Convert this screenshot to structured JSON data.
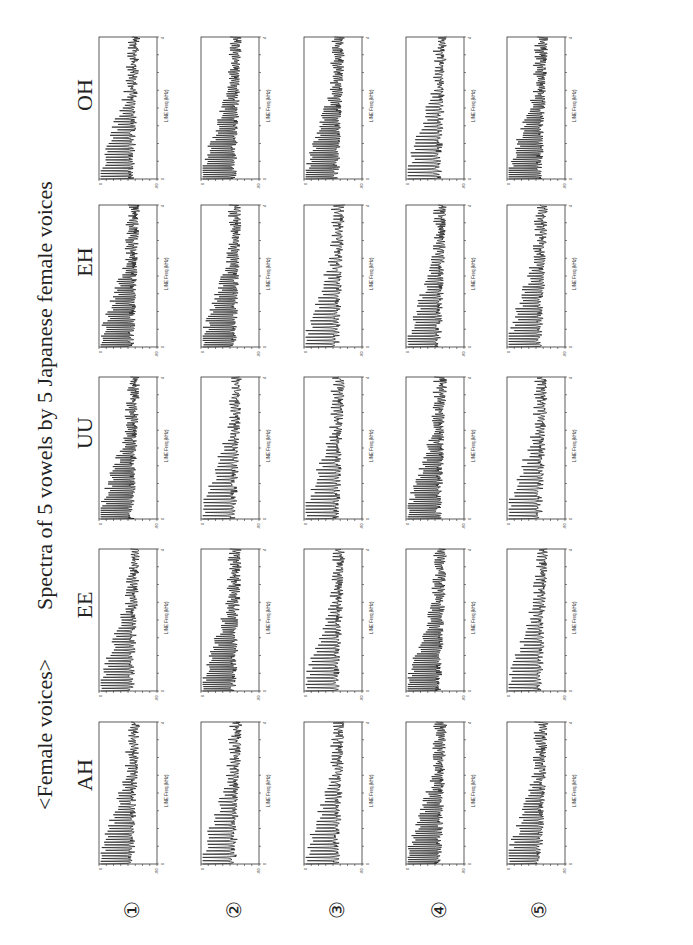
{
  "header": {
    "group_label": "<Female voices>",
    "title": "Spectra of 5 vowels by 5 Japanese female voices"
  },
  "columns": [
    {
      "label": "AH"
    },
    {
      "label": "EE"
    },
    {
      "label": "UU"
    },
    {
      "label": "EH"
    },
    {
      "label": "OH"
    }
  ],
  "rows": [
    {
      "label": "①"
    },
    {
      "label": "②"
    },
    {
      "label": "③"
    },
    {
      "label": "④"
    },
    {
      "label": "⑤"
    }
  ],
  "axes": {
    "ylabel": "MAG. (dB)",
    "xlabel": "LINE Freq.(kHz)",
    "y_ticks": [
      "0",
      "-80"
    ],
    "x_ticks": [
      "0",
      "4"
    ]
  },
  "colors": {
    "trace": "#1a1a1a",
    "frame": "#333333"
  },
  "chart_data": {
    "type": "line",
    "title": "Spectra of 5 vowels by 5 Japanese female voices",
    "subtitle": "<Female voices>",
    "layout": "5x5 grid of small multiples; columns = vowels (AH, EE, UU, EH, OH), rows = speakers (1-5)",
    "xlabel": "LINE Freq.(kHz)",
    "ylabel": "MAG. (dB)",
    "xlim": [
      0,
      4
    ],
    "ylim": [
      -80,
      0
    ],
    "x_tick_count": 9,
    "y_tick_count": 9,
    "grid": false,
    "series_description": "Each panel shows a harmonic magnitude spectrum: strong harmonic peaks (near 0 to -20 dB) below ~1.5 kHz, tapering to a noisy floor around -40 to -60 dB toward 4 kHz",
    "panels": [
      {
        "row": 1,
        "vowel": "AH"
      },
      {
        "row": 1,
        "vowel": "EE"
      },
      {
        "row": 1,
        "vowel": "UU"
      },
      {
        "row": 1,
        "vowel": "EH"
      },
      {
        "row": 1,
        "vowel": "OH"
      },
      {
        "row": 2,
        "vowel": "AH"
      },
      {
        "row": 2,
        "vowel": "EE"
      },
      {
        "row": 2,
        "vowel": "UU"
      },
      {
        "row": 2,
        "vowel": "EH"
      },
      {
        "row": 2,
        "vowel": "OH"
      },
      {
        "row": 3,
        "vowel": "AH"
      },
      {
        "row": 3,
        "vowel": "EE"
      },
      {
        "row": 3,
        "vowel": "UU"
      },
      {
        "row": 3,
        "vowel": "EH"
      },
      {
        "row": 3,
        "vowel": "OH"
      },
      {
        "row": 4,
        "vowel": "AH"
      },
      {
        "row": 4,
        "vowel": "EE"
      },
      {
        "row": 4,
        "vowel": "UU"
      },
      {
        "row": 4,
        "vowel": "EH"
      },
      {
        "row": 4,
        "vowel": "OH"
      },
      {
        "row": 5,
        "vowel": "AH"
      },
      {
        "row": 5,
        "vowel": "EE"
      },
      {
        "row": 5,
        "vowel": "UU"
      },
      {
        "row": 5,
        "vowel": "EH"
      },
      {
        "row": 5,
        "vowel": "OH"
      }
    ]
  }
}
